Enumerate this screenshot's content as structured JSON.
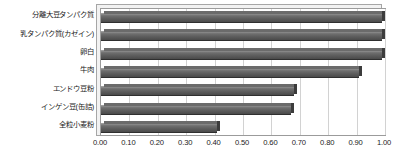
{
  "chart_data": {
    "type": "bar",
    "orientation": "horizontal",
    "title": "",
    "xlabel": "",
    "ylabel": "",
    "categories": [
      "分離大豆タンパク質",
      "乳タンパク質(カゼイン)",
      "卵白",
      "牛肉",
      "エンドウ豆粉",
      "インゲン豆(缶詰)",
      "全粒小麦粉"
    ],
    "values": [
      1.0,
      1.0,
      1.0,
      0.92,
      0.69,
      0.68,
      0.42
    ],
    "xlim": [
      0.0,
      1.0
    ],
    "xticks": [
      0.0,
      0.1,
      0.2,
      0.3,
      0.4,
      0.5,
      0.6,
      0.7,
      0.8,
      0.9,
      1.0
    ],
    "xtick_labels": [
      "0.00",
      "0.10",
      "0.20",
      "0.30",
      "0.40",
      "0.50",
      "0.60",
      "0.70",
      "0.80",
      "0.90",
      "1.00"
    ],
    "grid": true,
    "grid_axis": "x",
    "legend": false,
    "bar_color": "#5e5e5e",
    "gridline_color": "#d2d2d2",
    "plot_border_color": "#9b9b9b",
    "background_color": "#ffffff",
    "style": "3d-bevel"
  }
}
